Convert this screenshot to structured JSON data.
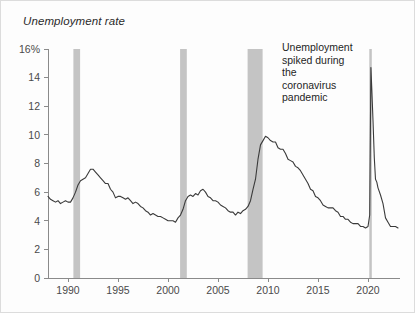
{
  "chart_data": {
    "type": "line",
    "title": "Unemployment rate",
    "xlabel": "",
    "ylabel": "",
    "xlim": [
      1988.0,
      2023.2
    ],
    "ylim": [
      0,
      16
    ],
    "grid": false,
    "legend": "none",
    "y_ticks": [
      "0",
      "2",
      "4",
      "6",
      "8",
      "10",
      "12",
      "14",
      "16%"
    ],
    "y_tick_values": [
      0,
      2,
      4,
      6,
      8,
      10,
      12,
      14,
      16
    ],
    "x_ticks": [
      "1990",
      "1995",
      "2000",
      "2005",
      "2010",
      "2015",
      "2020"
    ],
    "x_tick_values": [
      1990,
      1995,
      2000,
      2005,
      2010,
      2015,
      2020
    ],
    "line_color": "#3a3a3a",
    "recession_band_color": "#c4c4c4",
    "annotations": [
      {
        "text": "Unemployment spiked during the coronavirus pandemic",
        "lines": [
          "Unemployment",
          "spiked during",
          "the",
          "coronavirus",
          "pandemic"
        ],
        "x": 2018.0,
        "y": 15.3
      }
    ],
    "recession_bands": [
      {
        "name": "1990-91 recession",
        "start": 1990.54,
        "end": 1991.21
      },
      {
        "name": "2001 recession",
        "start": 2001.21,
        "end": 2001.88
      },
      {
        "name": "2007-09 Great Recession",
        "start": 2007.96,
        "end": 2009.46
      },
      {
        "name": "2020 COVID recession",
        "start": 2020.13,
        "end": 2020.38
      }
    ],
    "series": [
      {
        "name": "Unemployment rate",
        "x": [
          1988.0,
          1988.25,
          1988.5,
          1988.75,
          1989.0,
          1989.25,
          1989.5,
          1989.75,
          1990.0,
          1990.25,
          1990.5,
          1990.75,
          1991.0,
          1991.25,
          1991.5,
          1991.75,
          1992.0,
          1992.25,
          1992.5,
          1992.75,
          1993.0,
          1993.25,
          1993.5,
          1993.75,
          1994.0,
          1994.25,
          1994.5,
          1994.75,
          1995.0,
          1995.25,
          1995.5,
          1995.75,
          1996.0,
          1996.25,
          1996.5,
          1996.75,
          1997.0,
          1997.25,
          1997.5,
          1997.75,
          1998.0,
          1998.25,
          1998.5,
          1998.75,
          1999.0,
          1999.25,
          1999.5,
          1999.75,
          2000.0,
          2000.25,
          2000.5,
          2000.75,
          2001.0,
          2001.25,
          2001.5,
          2001.75,
          2002.0,
          2002.25,
          2002.5,
          2002.75,
          2003.0,
          2003.25,
          2003.5,
          2003.75,
          2004.0,
          2004.25,
          2004.5,
          2004.75,
          2005.0,
          2005.25,
          2005.5,
          2005.75,
          2006.0,
          2006.25,
          2006.5,
          2006.75,
          2007.0,
          2007.25,
          2007.5,
          2007.75,
          2008.0,
          2008.25,
          2008.5,
          2008.75,
          2009.0,
          2009.25,
          2009.5,
          2009.75,
          2010.0,
          2010.25,
          2010.5,
          2010.75,
          2011.0,
          2011.25,
          2011.5,
          2011.75,
          2012.0,
          2012.25,
          2012.5,
          2012.75,
          2013.0,
          2013.25,
          2013.5,
          2013.75,
          2014.0,
          2014.25,
          2014.5,
          2014.75,
          2015.0,
          2015.25,
          2015.5,
          2015.75,
          2016.0,
          2016.25,
          2016.5,
          2016.75,
          2017.0,
          2017.25,
          2017.5,
          2017.75,
          2018.0,
          2018.25,
          2018.5,
          2018.75,
          2019.0,
          2019.25,
          2019.5,
          2019.75,
          2020.0,
          2020.17,
          2020.29,
          2020.38,
          2020.5,
          2020.63,
          2020.75,
          2020.88,
          2021.0,
          2021.25,
          2021.5,
          2021.75,
          2022.0,
          2022.25,
          2022.5,
          2022.75,
          2023.0
        ],
        "values": [
          5.7,
          5.5,
          5.4,
          5.3,
          5.4,
          5.2,
          5.3,
          5.4,
          5.3,
          5.3,
          5.6,
          6.0,
          6.5,
          6.8,
          6.9,
          7.0,
          7.3,
          7.6,
          7.6,
          7.4,
          7.2,
          7.0,
          6.8,
          6.6,
          6.6,
          6.2,
          6.0,
          5.6,
          5.7,
          5.7,
          5.6,
          5.5,
          5.6,
          5.4,
          5.2,
          5.3,
          5.2,
          5.0,
          4.9,
          4.7,
          4.6,
          4.4,
          4.5,
          4.4,
          4.3,
          4.3,
          4.2,
          4.1,
          4.0,
          4.0,
          4.0,
          3.9,
          4.2,
          4.4,
          4.8,
          5.4,
          5.7,
          5.8,
          5.7,
          5.9,
          5.8,
          6.1,
          6.2,
          6.0,
          5.7,
          5.6,
          5.4,
          5.4,
          5.3,
          5.1,
          5.0,
          4.9,
          4.7,
          4.6,
          4.6,
          4.4,
          4.6,
          4.5,
          4.7,
          4.8,
          5.0,
          5.4,
          6.2,
          6.9,
          8.3,
          9.3,
          9.6,
          9.9,
          9.8,
          9.6,
          9.5,
          9.5,
          9.1,
          9.0,
          9.0,
          8.7,
          8.3,
          8.2,
          8.1,
          7.8,
          7.7,
          7.5,
          7.2,
          6.9,
          6.6,
          6.2,
          6.1,
          5.7,
          5.6,
          5.4,
          5.1,
          5.0,
          4.9,
          4.9,
          4.9,
          4.7,
          4.6,
          4.3,
          4.3,
          4.1,
          4.1,
          3.9,
          3.8,
          3.8,
          3.8,
          3.6,
          3.6,
          3.5,
          3.6,
          4.4,
          14.7,
          13.2,
          11.0,
          8.4,
          6.9,
          6.7,
          6.3,
          5.8,
          5.2,
          4.2,
          3.9,
          3.6,
          3.6,
          3.6,
          3.5
        ],
        "key_points": [
          {
            "label": "1992 peak",
            "year": 1992.5,
            "value": 7.8
          },
          {
            "label": "2000 trough",
            "year": 2000.75,
            "value": 3.9
          },
          {
            "label": "2003 peak",
            "year": 2003.5,
            "value": 6.3
          },
          {
            "label": "2006-07 trough",
            "year": 2006.75,
            "value": 4.4
          },
          {
            "label": "2009-10 peak",
            "year": 2009.75,
            "value": 10.0
          },
          {
            "label": "2019 trough",
            "year": 2019.75,
            "value": 3.5
          },
          {
            "label": "2020 COVID peak",
            "year": 2020.29,
            "value": 14.7
          },
          {
            "label": "2023 end",
            "year": 2023.0,
            "value": 3.5
          }
        ]
      }
    ]
  }
}
